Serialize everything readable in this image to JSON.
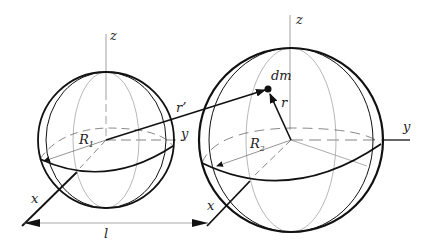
{
  "diagram": {
    "labels": {
      "z1": "z",
      "y1": "y",
      "x1": "x",
      "R1": "R",
      "R1_sub": "1",
      "r_prime": "r’",
      "z2": "z",
      "y2": "y",
      "x2": "x",
      "R2": "R",
      "R2_sub": "2",
      "dm": "dm",
      "r": "r",
      "l": "l"
    },
    "colors": {
      "stroke": "#111111",
      "thin": "#888888",
      "background": "#ffffff"
    }
  }
}
